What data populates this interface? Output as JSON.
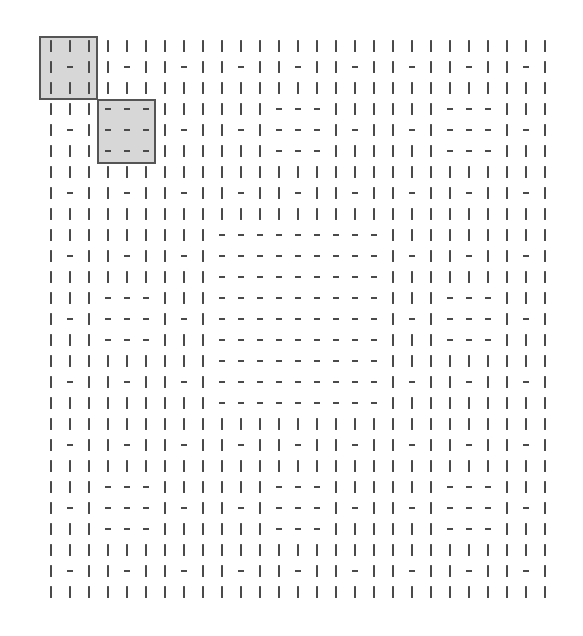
{
  "grid": {
    "rows": 27,
    "cols": 27,
    "block_size": 3,
    "symbols": {
      "|": "vertical-bar",
      "-": "horizontal-dash"
    },
    "block_map": [
      "LLLLLLLLL",
      "LDLLDLLDL",
      "LLLLLLLLL",
      "LLLDDDLLL",
      "LDLDDDLDL",
      "LLLDDDLLL",
      "LLLLLLLLL",
      "LDLLDLLDL",
      "LLLLLLLLL"
    ],
    "block_patterns": {
      "L": [
        "|||",
        "|-|",
        "|||"
      ],
      "D": [
        "---",
        "---",
        "---"
      ]
    },
    "cells": [
      "|||||||||||||||||||||||||||",
      "|-||-||-||-||-||-||-||-||-|",
      "|||||||||||||||||||||||||||",
      "|||---||||||---||||||---|||",
      "|-|---|-||-|---|-||-|---|-|",
      "|||---||||||---||||||---|||",
      "|||||||||||||||||||||||||||",
      "|-||-||-||-||-||-||-||-||-|",
      "|||||||||||||||||||||||||||",
      "|||||||||---------|||||||||",
      "|-||-||-|---------|-||-||-|",
      "|||||||||---------|||||||||",
      "|||---|||---------|||---|||",
      "|-|---|-|---------|-|---|-|",
      "|||---|||---------|||---|||",
      "|||||||||---------|||||||||",
      "|-||-||-|---------|-||-||-|",
      "|||||||||---------|||||||||",
      "|||||||||||||||||||||||||||",
      "|-||-||-||-||-||-||-||-||-|",
      "|||||||||||||||||||||||||||",
      "|||---||||||---||||||---|||",
      "|-|---|-||-|---|-||-|---|-|",
      "|||---||||||---||||||---|||",
      "|||||||||||||||||||||||||||",
      "|-||-||-||-||-||-||-||-||-|",
      "|||||||||||||||||||||||||||"
    ],
    "layout": {
      "origin_x": 51,
      "origin_y": 46,
      "col_step": 19.0,
      "row_step": 21.0
    }
  },
  "highlights": [
    {
      "label": "block-0-0",
      "block_row": 0,
      "block_col": 0,
      "x": 39,
      "y": 36,
      "w": 59,
      "h": 64
    },
    {
      "label": "block-1-1",
      "block_row": 1,
      "block_col": 1,
      "x": 97,
      "y": 99,
      "w": 59,
      "h": 65
    }
  ],
  "colors": {
    "symbol": "#4a4a4a",
    "highlight_fill": "#d7d7d7",
    "highlight_border": "#555555",
    "background": "#ffffff"
  }
}
